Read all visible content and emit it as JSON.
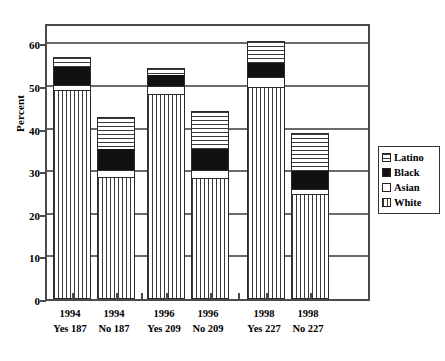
{
  "chart_data": {
    "type": "bar",
    "subtype": "stacked-bar",
    "title": "",
    "xlabel": "",
    "ylabel": "Percent",
    "ylim": [
      0,
      65
    ],
    "yticks": [
      0,
      10,
      20,
      30,
      40,
      50,
      60
    ],
    "ytick_labels": [
      "0",
      "10",
      "20",
      "30",
      "40",
      "50",
      "60"
    ],
    "grid": "horizontal",
    "legend_position": "right",
    "categories": [
      "1994 Yes 187",
      "1994 No  187",
      "1996 Yes 209",
      "1996 No  209",
      "1998 Yes 227",
      "1998 No  227"
    ],
    "category_lines": [
      {
        "line1": "1994",
        "line2": "Yes 187"
      },
      {
        "line1": "1994",
        "line2": "No  187"
      },
      {
        "line1": "1996",
        "line2": "Yes 209"
      },
      {
        "line1": "1996",
        "line2": "No  209"
      },
      {
        "line1": "1998",
        "line2": "Yes 227"
      },
      {
        "line1": "1998",
        "line2": "No  227"
      }
    ],
    "series": [
      {
        "name": "White",
        "pattern": "vertical-lines",
        "values": [
          48.7,
          28.5,
          47.9,
          28.2,
          49.5,
          24.3
        ]
      },
      {
        "name": "Asian",
        "pattern": "solid-white",
        "values": [
          1.2,
          1.6,
          1.8,
          1.9,
          2.3,
          1.3
        ]
      },
      {
        "name": "Black",
        "pattern": "solid-black",
        "values": [
          4.5,
          5.0,
          2.8,
          5.0,
          3.5,
          4.4
        ]
      },
      {
        "name": "Latino",
        "pattern": "horizontal-lines",
        "values": [
          2.2,
          7.4,
          1.5,
          8.9,
          5.1,
          8.7
        ]
      }
    ],
    "totals": [
      56.6,
      42.5,
      54.0,
      44.0,
      60.4,
      38.7
    ],
    "stack_order_bottom_to_top": [
      "White",
      "Asian",
      "Black",
      "Latino"
    ]
  },
  "legend": {
    "entries": [
      {
        "label": "Latino",
        "pattern": "horizontal-lines"
      },
      {
        "label": "Black",
        "pattern": "solid-black"
      },
      {
        "label": "Asian",
        "pattern": "solid-white"
      },
      {
        "label": "White",
        "pattern": "vertical-lines"
      }
    ]
  },
  "colors": {
    "frame": "#4a4a4a",
    "gridline": "#6b6b6b",
    "bar_outline": "#2b2b2b",
    "hatch": "#3a3a3a",
    "black_fill": "#111111",
    "background": "#ffffff"
  }
}
